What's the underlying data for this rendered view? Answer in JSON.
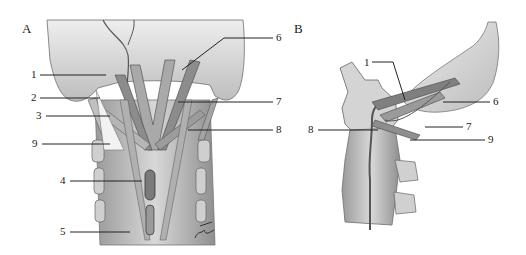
{
  "figure": {
    "panels": [
      {
        "letter": "A",
        "view": "posterior view of suboccipital / upper cervical region"
      },
      {
        "letter": "B",
        "view": "lateral view of upper cervical spine"
      }
    ],
    "panel_a_labels": [
      "1",
      "2",
      "3",
      "9",
      "4",
      "5",
      "6",
      "7",
      "8"
    ],
    "panel_b_labels": [
      "1",
      "8",
      "6",
      "7",
      "9"
    ],
    "signature": "artist signature"
  },
  "colors": {
    "background": "#ffffff",
    "ink": "#222222",
    "tissue_light": "#d9d9d9",
    "tissue_mid": "#a8a8a8",
    "tissue_dark": "#5a5a5a"
  }
}
